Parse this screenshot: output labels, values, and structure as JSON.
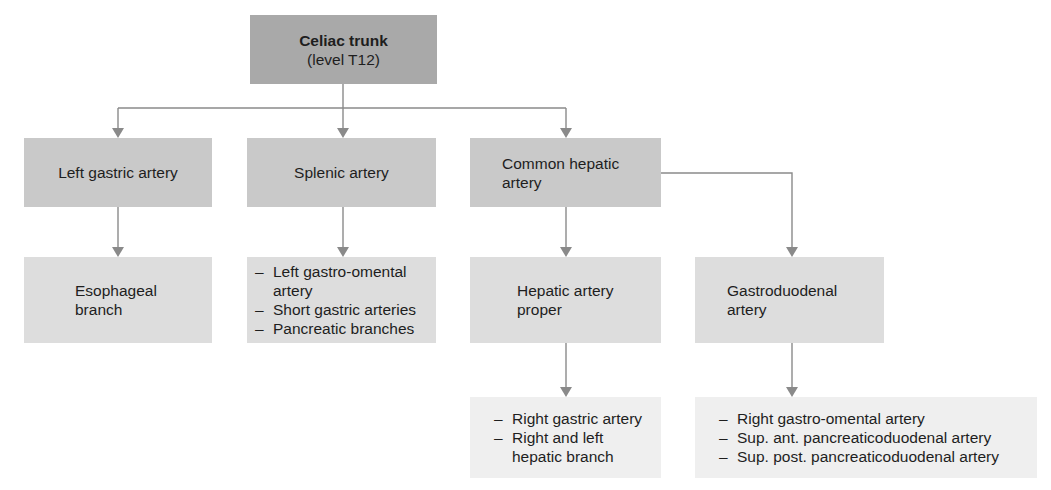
{
  "diagram": {
    "root": {
      "title": "Celiac trunk",
      "subtitle": "(level T12)"
    },
    "branches": [
      {
        "label": "Left gastric artery",
        "children": [
          {
            "label": "Esophageal branch",
            "lines": [
              "Esophageal",
              "branch"
            ]
          }
        ]
      },
      {
        "label": "Splenic artery",
        "children": [
          {
            "items": [
              "Left gastro-omental artery",
              "Short gastric arteries",
              "Pancreatic branches"
            ],
            "display": [
              "Left gastro-omental",
              "artery"
            ]
          }
        ]
      },
      {
        "label": "Common hepatic artery",
        "lines": [
          "Common hepatic",
          "artery"
        ],
        "children": [
          {
            "label": "Hepatic artery proper",
            "lines": [
              "Hepatic artery",
              "proper"
            ],
            "children": [
              {
                "items": [
                  "Right gastric artery",
                  "Right and left hepatic branch"
                ],
                "display": [
                  "Right and left",
                  "hepatic branch"
                ]
              }
            ]
          },
          {
            "label": "Gastroduodenal artery",
            "lines": [
              "Gastroduodenal",
              "artery"
            ],
            "children": [
              {
                "items": [
                  "Right gastro-omental artery",
                  "Sup. ant. pancreaticoduodenal artery",
                  "Sup. post. pancreaticoduodenal artery"
                ]
              }
            ]
          }
        ]
      }
    ]
  },
  "colors": {
    "level1": "#a9a9a9",
    "level2": "#c9c9c9",
    "level3": "#dddddd",
    "level4": "#efefef",
    "connector": "#8a8a8a"
  }
}
